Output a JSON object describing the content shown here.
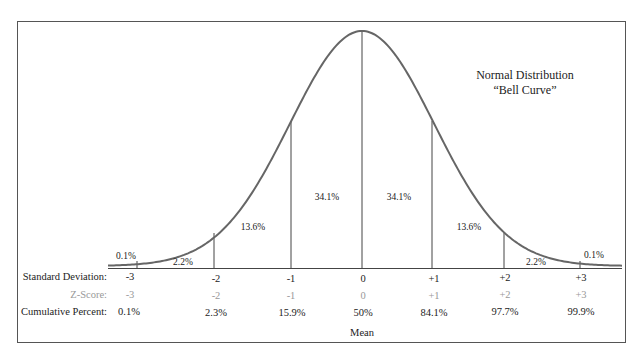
{
  "chart_data": {
    "type": "line",
    "title": "Normal Distribution",
    "subtitle": "“Bell Curve”",
    "x": [
      -3,
      -2,
      -1,
      0,
      1,
      2,
      3
    ],
    "xlabel": "Mean",
    "segments": [
      {
        "range": "< -3",
        "percent": "0.1%"
      },
      {
        "range": "-3 to -2",
        "percent": "2.2%"
      },
      {
        "range": "-2 to -1",
        "percent": "13.6%"
      },
      {
        "range": "-1 to 0",
        "percent": "34.1%"
      },
      {
        "range": "0 to +1",
        "percent": "34.1%"
      },
      {
        "range": "+1 to +2",
        "percent": "13.6%"
      },
      {
        "range": "+2 to +3",
        "percent": "2.2%"
      },
      {
        "range": "> +3",
        "percent": "0.1%"
      }
    ],
    "rows": {
      "standard_deviation": {
        "label": "Standard Deviation:",
        "values": [
          "-3",
          "-2",
          "-1",
          "0",
          "+1",
          "+2",
          "+3"
        ]
      },
      "z_score": {
        "label": "Z-Score:",
        "values": [
          "-3",
          "-2",
          "-1",
          "0",
          "+1",
          "+2",
          "+3"
        ]
      },
      "cumulative_percent": {
        "label": "Cumulative Percent:",
        "values": [
          "0.1%",
          "2.3%",
          "15.9%",
          "50%",
          "84.1%",
          "97.7%",
          "99.9%"
        ]
      }
    },
    "grid": false,
    "legend": "none"
  },
  "title": {
    "line1": "Normal Distribution",
    "line2": "“Bell Curve”"
  },
  "segment_labels": [
    "0.1%",
    "2.2%",
    "13.6%",
    "34.1%",
    "34.1%",
    "13.6%",
    "2.2%",
    "0.1%"
  ],
  "rows": {
    "sd_label": "Standard Deviation:",
    "sd": [
      "-3",
      "-2",
      "-1",
      "0",
      "+1",
      "+2",
      "+3"
    ],
    "z_label": "Z-Score:",
    "z": [
      "-3",
      "-2",
      "-1",
      "0",
      "+1",
      "+2",
      "+3"
    ],
    "cum_label": "Cumulative Percent:",
    "cum": [
      "0.1%",
      "2.3%",
      "15.9%",
      "50%",
      "84.1%",
      "97.7%",
      "99.9%"
    ]
  },
  "mean_label": "Mean"
}
